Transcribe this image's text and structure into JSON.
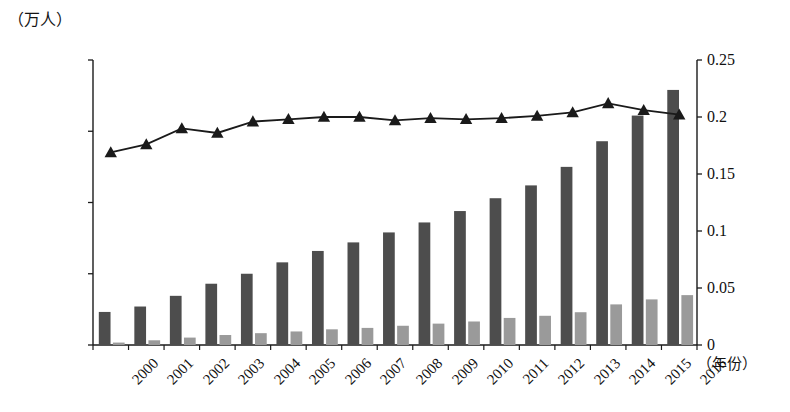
{
  "chart_data": {
    "type": "bar",
    "title": "",
    "subtitle": "",
    "xlabel": "（年份）",
    "ylabel": "（万人）",
    "ylabel_right": "",
    "categories": [
      "2000",
      "2001",
      "2002",
      "2003",
      "2004",
      "2005",
      "2006",
      "2007",
      "2008",
      "2009",
      "2010",
      "2011",
      "2012",
      "2013",
      "2014",
      "2015",
      "2016"
    ],
    "ylim": [
      0,
      20000
    ],
    "yticks": [
      "0",
      "5000",
      "10000",
      "15000",
      "20000"
    ],
    "ytick_values": [
      0,
      5000,
      10000,
      15000,
      20000
    ],
    "ylim_right": [
      0,
      0.25
    ],
    "yticks_right": [
      "0",
      "0.05",
      "0.1",
      "0.15",
      "0.2",
      "0.25"
    ],
    "ytick_values_right": [
      0,
      0.05,
      0.1,
      0.15,
      0.2,
      0.25
    ],
    "grid": false,
    "legend_position": "none",
    "series": [
      {
        "name": "series-dark-bar",
        "type": "bar",
        "axis": "left",
        "color": "#4d4d4d",
        "values": [
          2320,
          2700,
          3450,
          4300,
          5000,
          5800,
          6600,
          7200,
          7900,
          8600,
          9400,
          10300,
          11200,
          12500,
          14300,
          16100,
          17900
        ]
      },
      {
        "name": "series-light-bar",
        "type": "bar",
        "axis": "left",
        "color": "#9a9a9a",
        "values": [
          170,
          330,
          520,
          700,
          830,
          950,
          1100,
          1200,
          1350,
          1500,
          1650,
          1900,
          2050,
          2300,
          2850,
          3200,
          3500
        ]
      },
      {
        "name": "series-line",
        "type": "line",
        "axis": "right",
        "color": "#1a1a1a",
        "marker": "triangle",
        "values": [
          0.169,
          0.176,
          0.19,
          0.186,
          0.196,
          0.198,
          0.2,
          0.2,
          0.197,
          0.199,
          0.198,
          0.199,
          0.201,
          0.204,
          0.212,
          0.206,
          0.202
        ]
      }
    ],
    "annotations": []
  },
  "colors": {
    "axis": "#1a1a1a",
    "dark_bar": "#4d4d4d",
    "light_bar": "#9a9a9a",
    "line": "#1a1a1a",
    "background": "#ffffff"
  },
  "bottom_caption": ""
}
